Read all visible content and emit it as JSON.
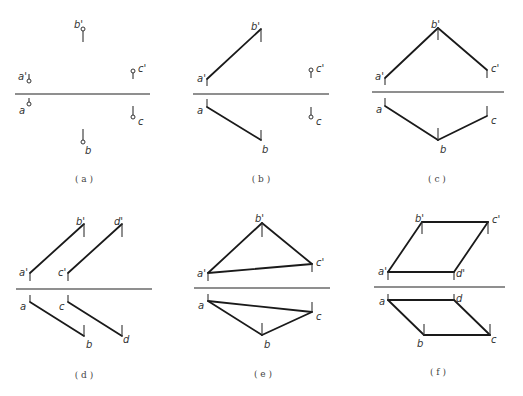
{
  "figure": {
    "panels": [
      {
        "id": "a",
        "caption": "( a )",
        "axis": {
          "x1": 15,
          "x2": 150,
          "y": 94
        },
        "points": [
          {
            "name": "a'",
            "x": 29,
            "y": 81,
            "tick": [
              74,
              81
            ],
            "lx": 18,
            "ly": 80
          },
          {
            "name": "a",
            "x": 29,
            "y": 104,
            "tick": [
              98,
              104
            ],
            "lx": 19,
            "ly": 114
          },
          {
            "name": "b'",
            "x": 83,
            "y": 29,
            "tick": [
              29,
              42
            ],
            "lx": 74,
            "ly": 28
          },
          {
            "name": "b",
            "x": 83,
            "y": 142,
            "tick": [
              129,
              142
            ],
            "lx": 85,
            "ly": 154
          },
          {
            "name": "c'",
            "x": 133,
            "y": 71,
            "tick": [
              71,
              79
            ],
            "lx": 138,
            "ly": 72
          },
          {
            "name": "c",
            "x": 133,
            "y": 117,
            "tick": [
              106,
              117
            ],
            "lx": 138,
            "ly": 125
          }
        ],
        "edges": [],
        "caption_pos": {
          "x": 84,
          "y": 182
        }
      },
      {
        "id": "b",
        "caption": "( b )",
        "axis": {
          "x1": 193,
          "x2": 329,
          "y": 94
        },
        "points": [
          {
            "name": "a'",
            "x": 207,
            "y": 79,
            "tick": [
              79,
              86
            ],
            "lx": 197,
            "ly": 82
          },
          {
            "name": "a",
            "x": 207,
            "y": 107,
            "tick": [
              99,
              107
            ],
            "lx": 197,
            "ly": 114
          },
          {
            "name": "b'",
            "x": 261,
            "y": 29,
            "tick": [
              29,
              42
            ],
            "lx": 251,
            "ly": 30
          },
          {
            "name": "b",
            "x": 261,
            "y": 140,
            "tick": [
              130,
              140
            ],
            "lx": 262,
            "ly": 153
          },
          {
            "name": "c'",
            "x": 311,
            "y": 70,
            "tick": [
              70,
              78
            ],
            "lx": 316,
            "ly": 72
          },
          {
            "name": "c",
            "x": 311,
            "y": 117,
            "tick": [
              107,
              117
            ],
            "lx": 316,
            "ly": 125
          }
        ],
        "edges": [
          [
            "a'",
            "b'"
          ],
          [
            "a",
            "b"
          ]
        ],
        "open_points": [
          "c'",
          "c"
        ],
        "caption_pos": {
          "x": 261,
          "y": 182
        }
      },
      {
        "id": "c",
        "caption": "( c )",
        "axis": {
          "x1": 372,
          "x2": 504,
          "y": 92
        },
        "points": [
          {
            "name": "a'",
            "x": 385,
            "y": 78,
            "tick": [
              78,
              85
            ],
            "lx": 375,
            "ly": 80
          },
          {
            "name": "a",
            "x": 385,
            "y": 106,
            "tick": [
              98,
              106
            ],
            "lx": 376,
            "ly": 113
          },
          {
            "name": "b'",
            "x": 438,
            "y": 28,
            "tick": [
              28,
              40
            ],
            "lx": 431,
            "ly": 28
          },
          {
            "name": "b",
            "x": 438,
            "y": 140,
            "tick": [
              128,
              140
            ],
            "lx": 440,
            "ly": 153
          },
          {
            "name": "c'",
            "x": 487,
            "y": 70,
            "tick": [
              70,
              78
            ],
            "lx": 491,
            "ly": 72
          },
          {
            "name": "c",
            "x": 487,
            "y": 116,
            "tick": [
              106,
              116
            ],
            "lx": 491,
            "ly": 124
          }
        ],
        "edges": [
          [
            "a'",
            "b'"
          ],
          [
            "b'",
            "c'"
          ],
          [
            "a",
            "b"
          ],
          [
            "b",
            "c"
          ]
        ],
        "caption_pos": {
          "x": 437,
          "y": 182
        }
      },
      {
        "id": "d",
        "caption": "( d )",
        "axis": {
          "x1": 16,
          "x2": 152,
          "y": 289
        },
        "points": [
          {
            "name": "a'",
            "x": 30,
            "y": 273,
            "tick": [
              273,
              281
            ],
            "lx": 19,
            "ly": 276
          },
          {
            "name": "a",
            "x": 30,
            "y": 302,
            "tick": [
              295,
              302
            ],
            "lx": 20,
            "ly": 310
          },
          {
            "name": "b'",
            "x": 84,
            "y": 224,
            "tick": [
              224,
              237
            ],
            "lx": 76,
            "ly": 225
          },
          {
            "name": "b",
            "x": 84,
            "y": 336,
            "tick": [
              325,
              336
            ],
            "lx": 86,
            "ly": 348
          },
          {
            "name": "c'",
            "x": 68,
            "y": 273,
            "tick": [
              273,
              281
            ],
            "lx": 58,
            "ly": 276
          },
          {
            "name": "c",
            "x": 68,
            "y": 302,
            "tick": [
              295,
              302
            ],
            "lx": 59,
            "ly": 310
          },
          {
            "name": "d'",
            "x": 122,
            "y": 224,
            "tick": [
              224,
              237
            ],
            "lx": 114,
            "ly": 225
          },
          {
            "name": "d",
            "x": 122,
            "y": 336,
            "tick": [
              325,
              336
            ],
            "lx": 123,
            "ly": 343
          }
        ],
        "edges": [
          [
            "a'",
            "b'"
          ],
          [
            "c'",
            "d'"
          ],
          [
            "a",
            "b"
          ],
          [
            "c",
            "d"
          ]
        ],
        "caption_pos": {
          "x": 84,
          "y": 378
        }
      },
      {
        "id": "e",
        "caption": "( e )",
        "axis": {
          "x1": 194,
          "x2": 330,
          "y": 288
        },
        "points": [
          {
            "name": "a'",
            "x": 208,
            "y": 273,
            "tick": [
              273,
              281
            ],
            "lx": 197,
            "ly": 277
          },
          {
            "name": "a",
            "x": 208,
            "y": 301,
            "tick": [
              294,
              301
            ],
            "lx": 198,
            "ly": 309
          },
          {
            "name": "b'",
            "x": 262,
            "y": 223,
            "tick": [
              223,
              237
            ],
            "lx": 255,
            "ly": 222
          },
          {
            "name": "b",
            "x": 262,
            "y": 335,
            "tick": [
              323,
              335
            ],
            "lx": 264,
            "ly": 348
          },
          {
            "name": "c'",
            "x": 312,
            "y": 264,
            "tick": [
              264,
              272
            ],
            "lx": 316,
            "ly": 266
          },
          {
            "name": "c",
            "x": 312,
            "y": 312,
            "tick": [
              302,
              312
            ],
            "lx": 316,
            "ly": 320
          }
        ],
        "edges": [
          [
            "a'",
            "b'"
          ],
          [
            "b'",
            "c'"
          ],
          [
            "a'",
            "c'"
          ],
          [
            "a",
            "b"
          ],
          [
            "b",
            "c"
          ],
          [
            "a",
            "c"
          ]
        ],
        "caption_pos": {
          "x": 263,
          "y": 377
        }
      },
      {
        "id": "f",
        "caption": "( f )",
        "axis": {
          "x1": 374,
          "x2": 505,
          "y": 287
        },
        "points": [
          {
            "name": "a'",
            "x": 388,
            "y": 272,
            "tick": [
              272,
              280
            ],
            "lx": 378,
            "ly": 275
          },
          {
            "name": "a",
            "x": 388,
            "y": 300,
            "tick": [
              294,
              300
            ],
            "lx": 379,
            "ly": 305
          },
          {
            "name": "b'",
            "x": 422,
            "y": 222,
            "tick": [
              222,
              234
            ],
            "lx": 415,
            "ly": 222
          },
          {
            "name": "b",
            "x": 424,
            "y": 335,
            "tick": [
              324,
              335
            ],
            "lx": 417,
            "ly": 347
          },
          {
            "name": "c'",
            "x": 488,
            "y": 222,
            "tick": [
              222,
              234
            ],
            "lx": 492,
            "ly": 223
          },
          {
            "name": "c",
            "x": 490,
            "y": 335,
            "tick": [
              324,
              335
            ],
            "lx": 491,
            "ly": 343
          },
          {
            "name": "d'",
            "x": 454,
            "y": 272,
            "tick": [
              272,
              280
            ],
            "lx": 456,
            "ly": 277
          },
          {
            "name": "d",
            "x": 454,
            "y": 300,
            "tick": [
              294,
              300
            ],
            "lx": 456,
            "ly": 302
          }
        ],
        "edges": [
          [
            "a'",
            "b'"
          ],
          [
            "b'",
            "c'"
          ],
          [
            "c'",
            "d'"
          ],
          [
            "d'",
            "a'"
          ],
          [
            "a",
            "b"
          ],
          [
            "b",
            "c"
          ],
          [
            "c",
            "d"
          ],
          [
            "d",
            "a"
          ]
        ],
        "caption_pos": {
          "x": 438,
          "y": 375
        }
      }
    ]
  }
}
